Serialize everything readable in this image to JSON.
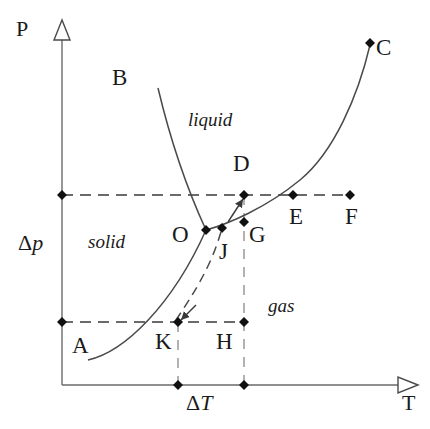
{
  "figure": {
    "type": "phase-diagram",
    "background_color": "#ffffff",
    "line_color": "#3a3a3a",
    "text_color": "#1a1a1a"
  },
  "axes": {
    "y_label": "P",
    "x_label": "T",
    "origin_x": 62,
    "origin_y": 385,
    "y_top": 24,
    "x_right": 418
  },
  "phase_regions": [
    {
      "id": "solid",
      "label": "solid",
      "x": 88,
      "y": 232
    },
    {
      "id": "liquid",
      "label": "liquid",
      "x": 188,
      "y": 110
    },
    {
      "id": "gas",
      "label": "gas",
      "x": 268,
      "y": 296
    }
  ],
  "points": [
    {
      "id": "A",
      "label": "A",
      "x": 62,
      "y": 322,
      "marker": true,
      "label_x": 72,
      "label_y": 334
    },
    {
      "id": "B",
      "label": "B",
      "x": 158,
      "y": 88,
      "marker": false,
      "label_x": 112,
      "label_y": 66
    },
    {
      "id": "C",
      "label": "C",
      "x": 370,
      "y": 43,
      "marker": true,
      "label_x": 376,
      "label_y": 36
    },
    {
      "id": "D",
      "label": "D",
      "x": 244,
      "y": 195,
      "marker": true,
      "label_x": 233,
      "label_y": 152
    },
    {
      "id": "E",
      "label": "E",
      "x": 293,
      "y": 195,
      "marker": true,
      "label_x": 289,
      "label_y": 205
    },
    {
      "id": "F",
      "label": "F",
      "x": 350,
      "y": 195,
      "marker": true,
      "label_x": 345,
      "label_y": 205
    },
    {
      "id": "G",
      "label": "G",
      "x": 244,
      "y": 222,
      "marker": true,
      "label_x": 249,
      "label_y": 223
    },
    {
      "id": "H",
      "label": "H",
      "x": 244,
      "y": 322,
      "marker": true,
      "label_x": 216,
      "label_y": 330
    },
    {
      "id": "J",
      "label": "J",
      "x": 222,
      "y": 228,
      "marker": true,
      "label_x": 219,
      "label_y": 240
    },
    {
      "id": "K",
      "label": "K",
      "x": 178,
      "y": 322,
      "marker": true,
      "label_x": 155,
      "label_y": 330
    },
    {
      "id": "O",
      "label": "O",
      "x": 206,
      "y": 230,
      "marker": true,
      "label_x": 172,
      "label_y": 223
    }
  ],
  "axis_ticks": [
    {
      "id": "tick-left",
      "x": 178,
      "y": 385
    },
    {
      "id": "tick-right",
      "x": 244,
      "y": 385
    }
  ],
  "annotations": {
    "delta_p": {
      "label_prefix": "Δ",
      "label_italic": "p",
      "x": 18,
      "y": 232
    },
    "delta_t": {
      "label_prefix": "Δ",
      "label_italic": "T",
      "x": 186,
      "y": 392
    }
  },
  "curves": {
    "fusion": "solid curve from B down to triple point O",
    "vaporization": "solid curve from triple point O up to critical point C",
    "sublimation": "solid curve from A region up to triple point O",
    "shifted_sublimation": "dashed curve from K up to J"
  },
  "guide_lines": {
    "upper_isobar": {
      "from_x": 62,
      "to_x": 350,
      "y": 195,
      "style": "dashed"
    },
    "lower_isobar": {
      "from_x": 62,
      "to_x": 244,
      "y": 322,
      "style": "dashed"
    },
    "vertical_dh": {
      "x": 244,
      "from_y": 195,
      "to_y": 385,
      "style": "dashed"
    },
    "vertical_k": {
      "x": 178,
      "from_y": 322,
      "to_y": 385,
      "style": "dashed"
    }
  }
}
